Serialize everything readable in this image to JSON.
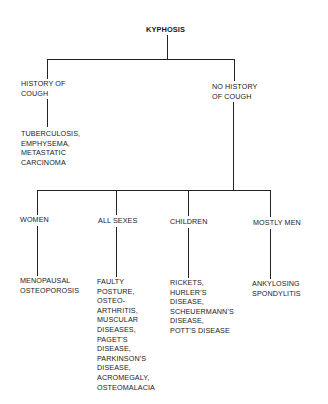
{
  "root": {
    "label": "KYPHOSIS"
  },
  "level1": [
    {
      "label": "HISTORY OF\nCOUGH",
      "causes": "TUBERCULOSIS,\nEMPHYSEMA,\nMETASTATIC\nCARCINOMA"
    },
    {
      "label": "NO HISTORY\nOF COUGH"
    }
  ],
  "level2": [
    {
      "label": "WOMEN",
      "causes": "MENOPAUSAL\nOSTEOPOROSIS"
    },
    {
      "label": "ALL SEXES",
      "causes": "FAULTY\nPOSTURE,\nOSTEO-\nARTHRITIS,\nMUSCULAR\nDISEASES,\nPAGET'S\nDISEASE,\nPARKINSON'S\nDISEASE,\nACROMEGALY,\nOSTEOMALACIA"
    },
    {
      "label": "CHILDREN",
      "causes": "RICKETS,\nHURLER'S\nDISEASE,\nSCHEUERMANN'S\nDISEASE,\nPOTT'S DISEASE"
    },
    {
      "label": "MOSTLY MEN",
      "causes": "ANKYLOSING\nSPONDYLITIS"
    }
  ]
}
